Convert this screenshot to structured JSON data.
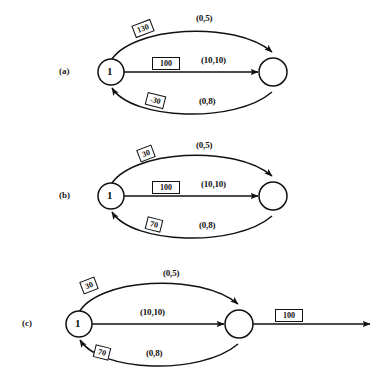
{
  "figure": {
    "type": "network-flow-diagram",
    "panel_count": 3,
    "stroke_color": "#111111",
    "background_color": "#ffffff"
  },
  "panels": [
    {
      "id": "a",
      "tag": "(a)",
      "source_node_label": "1",
      "sink_node_label": "",
      "top_arc": {
        "edge_label": "(0,5)",
        "box_value": "130",
        "direction": "forward"
      },
      "middle_edge": {
        "edge_label": "(10,10)",
        "box_value": "100",
        "direction": "forward"
      },
      "bottom_arc": {
        "edge_label": "(0,8)",
        "box_value": "-30",
        "direction": "backward"
      },
      "outgoing_edge": null
    },
    {
      "id": "b",
      "tag": "(b)",
      "source_node_label": "1",
      "sink_node_label": "",
      "top_arc": {
        "edge_label": "(0,5)",
        "box_value": "30",
        "direction": "forward"
      },
      "middle_edge": {
        "edge_label": "(10,10)",
        "box_value": "100",
        "direction": "forward"
      },
      "bottom_arc": {
        "edge_label": "(0,8)",
        "box_value": "70",
        "direction": "backward"
      },
      "outgoing_edge": null
    },
    {
      "id": "c",
      "tag": "(c)",
      "source_node_label": "1",
      "sink_node_label": "",
      "top_arc": {
        "edge_label": "(0,5)",
        "box_value": "30",
        "direction": "forward"
      },
      "middle_edge": {
        "edge_label": "(10,10)",
        "box_value": "",
        "direction": "forward"
      },
      "bottom_arc": {
        "edge_label": "(0,8)",
        "box_value": "70",
        "direction": "backward"
      },
      "outgoing_edge": {
        "edge_label": "",
        "box_value": "100",
        "direction": "forward"
      }
    }
  ]
}
